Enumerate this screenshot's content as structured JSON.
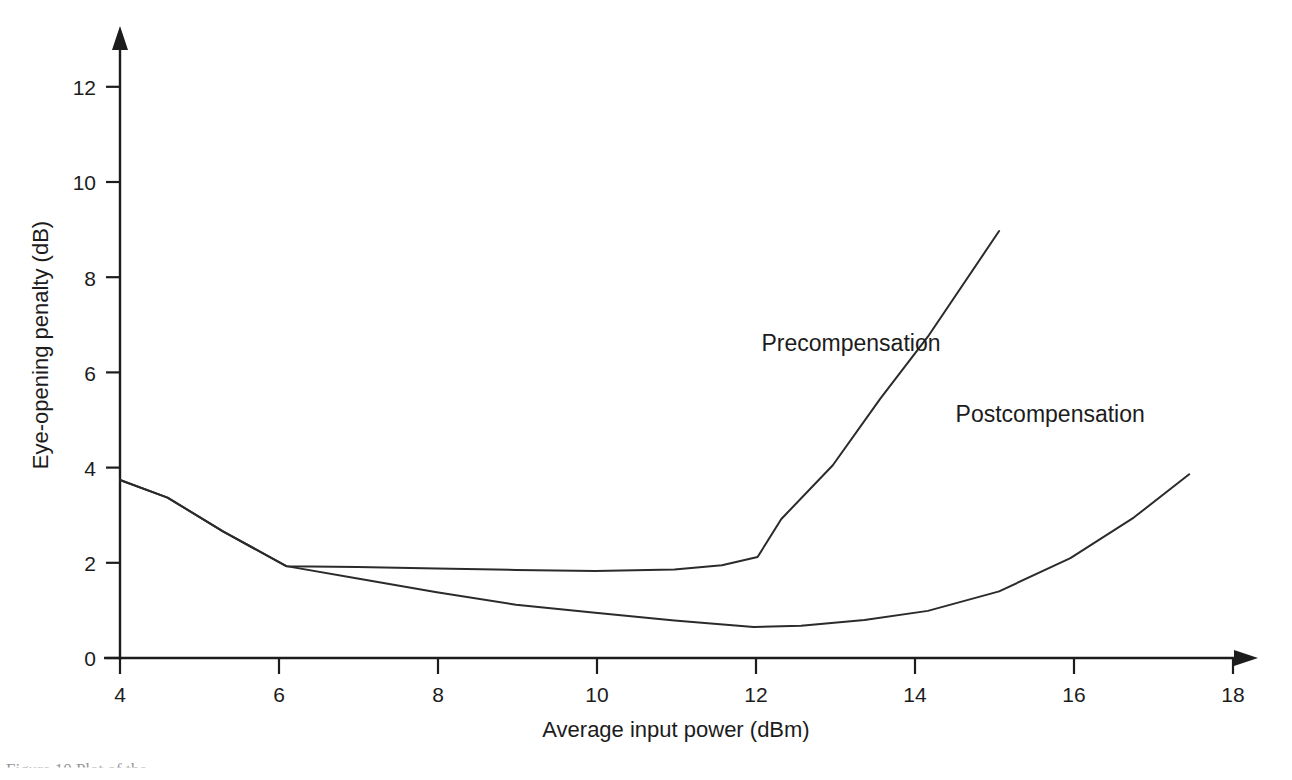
{
  "figure": {
    "caption_fragment": "Figure 10  Plot of the",
    "background_color": "#ffffff",
    "ink_color": "#1c1c1c"
  },
  "chart_data": {
    "type": "line",
    "title": "",
    "xlabel": "Average input power (dBm)",
    "ylabel": "Eye-opening penalty (dB)",
    "xlim": [
      4,
      18
    ],
    "ylim": [
      0,
      12.8
    ],
    "xticks": [
      4,
      6,
      8,
      10,
      12,
      14,
      16,
      18
    ],
    "xtick_labels": [
      "4",
      "6",
      "8",
      "10",
      "12",
      "14",
      "16",
      "18"
    ],
    "yticks": [
      0,
      2,
      4,
      6,
      8,
      10,
      12
    ],
    "ytick_labels": [
      "0",
      "2",
      "4",
      "6",
      "8",
      "10",
      "12"
    ],
    "grid": false,
    "legend_position": "inline-annotation",
    "series": [
      {
        "name": "Precompensation",
        "label_x": 12.1,
        "label_y": 6.45,
        "x": [
          4.0,
          4.6,
          5.3,
          6.1,
          7.0,
          8.0,
          9.0,
          10.0,
          11.0,
          11.6,
          12.05,
          12.35,
          13.0,
          13.6,
          14.2,
          15.1
        ],
        "y": [
          3.74,
          3.37,
          2.66,
          1.93,
          1.91,
          1.88,
          1.85,
          1.83,
          1.86,
          1.95,
          2.12,
          2.92,
          4.05,
          5.45,
          6.75,
          8.97
        ]
      },
      {
        "name": "Postcompensation",
        "label_x": 14.55,
        "label_y": 4.95,
        "x": [
          4.0,
          4.6,
          5.3,
          6.1,
          7.0,
          8.0,
          9.0,
          10.0,
          11.0,
          12.0,
          12.6,
          13.4,
          14.2,
          15.1,
          16.0,
          16.8,
          17.5
        ],
        "y": [
          3.74,
          3.37,
          2.66,
          1.93,
          1.67,
          1.38,
          1.12,
          0.95,
          0.79,
          0.65,
          0.68,
          0.8,
          0.99,
          1.4,
          2.1,
          2.95,
          3.86
        ]
      }
    ]
  }
}
